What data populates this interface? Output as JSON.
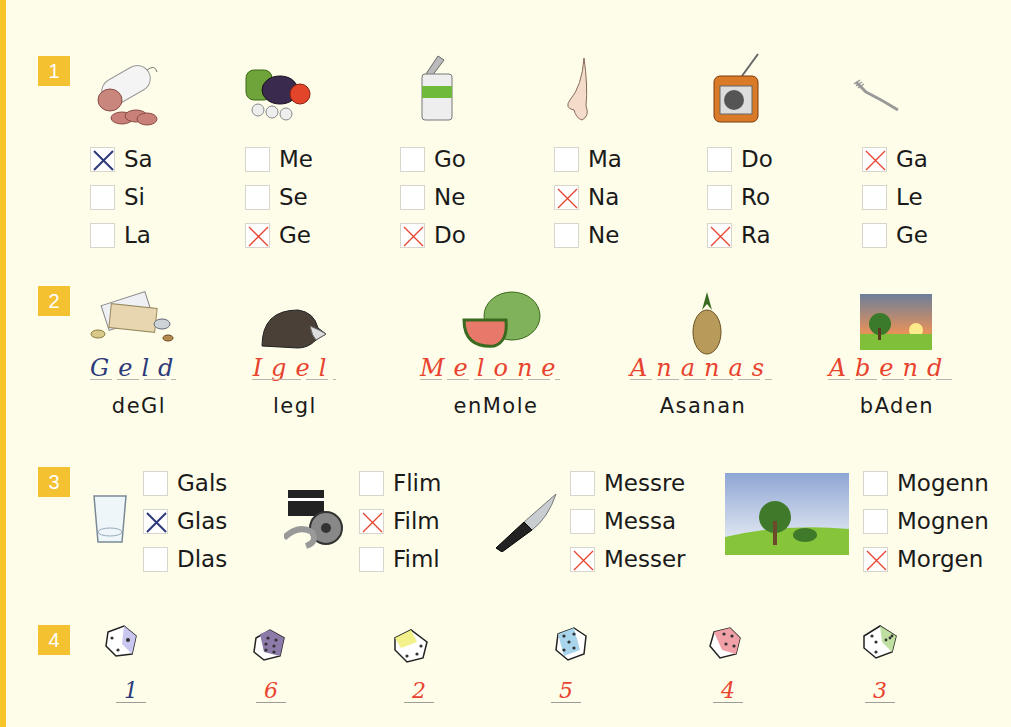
{
  "colors": {
    "background": "#fefde9",
    "stripe": "#f7c52a",
    "badge": "#f4c131",
    "answer_blue": "#2d3a7a",
    "answer_red": "#e8432f"
  },
  "exercise1": {
    "number": "1",
    "groups": [
      {
        "picture": "salami",
        "options": [
          {
            "label": "Sa",
            "checked": "blue"
          },
          {
            "label": "Si",
            "checked": ""
          },
          {
            "label": "La",
            "checked": ""
          }
        ]
      },
      {
        "picture": "vegetables",
        "options": [
          {
            "label": "Me",
            "checked": ""
          },
          {
            "label": "Se",
            "checked": ""
          },
          {
            "label": "Ge",
            "checked": "red"
          }
        ]
      },
      {
        "picture": "tin-can",
        "options": [
          {
            "label": "Go",
            "checked": ""
          },
          {
            "label": "Ne",
            "checked": ""
          },
          {
            "label": "Do",
            "checked": "red"
          }
        ]
      },
      {
        "picture": "nose",
        "options": [
          {
            "label": "Ma",
            "checked": ""
          },
          {
            "label": "Na",
            "checked": "red"
          },
          {
            "label": "Ne",
            "checked": ""
          }
        ]
      },
      {
        "picture": "radio",
        "options": [
          {
            "label": "Do",
            "checked": ""
          },
          {
            "label": "Ro",
            "checked": ""
          },
          {
            "label": "Ra",
            "checked": "red"
          }
        ]
      },
      {
        "picture": "fork",
        "options": [
          {
            "label": "Ga",
            "checked": "red"
          },
          {
            "label": "Le",
            "checked": ""
          },
          {
            "label": "Ge",
            "checked": ""
          }
        ]
      }
    ]
  },
  "exercise2": {
    "number": "2",
    "items": [
      {
        "picture": "money",
        "answer": "Geld",
        "answer_color": "blue",
        "scrambled": "deGl"
      },
      {
        "picture": "hedgehog",
        "answer": "Igel",
        "answer_color": "red",
        "scrambled": "legl"
      },
      {
        "picture": "watermelon",
        "answer": "Melone",
        "answer_color": "red",
        "scrambled": "enMole"
      },
      {
        "picture": "pineapple",
        "answer": "Ananas",
        "answer_color": "red",
        "scrambled": "Asanan"
      },
      {
        "picture": "evening-landscape",
        "answer": "Abend",
        "answer_color": "red",
        "scrambled": "bAden"
      }
    ]
  },
  "exercise3": {
    "number": "3",
    "groups": [
      {
        "picture": "glass",
        "options": [
          {
            "label": "Gals",
            "checked": ""
          },
          {
            "label": "Glas",
            "checked": "blue"
          },
          {
            "label": "Dlas",
            "checked": ""
          }
        ]
      },
      {
        "picture": "film-clapper-reel",
        "options": [
          {
            "label": "Flim",
            "checked": ""
          },
          {
            "label": "Film",
            "checked": "red"
          },
          {
            "label": "Fiml",
            "checked": ""
          }
        ]
      },
      {
        "picture": "knife",
        "options": [
          {
            "label": "Messre",
            "checked": ""
          },
          {
            "label": "Messa",
            "checked": ""
          },
          {
            "label": "Messer",
            "checked": "red"
          }
        ]
      },
      {
        "picture": "morning-landscape",
        "options": [
          {
            "label": "Mogenn",
            "checked": ""
          },
          {
            "label": "Mognen",
            "checked": ""
          },
          {
            "label": "Morgen",
            "checked": "red"
          }
        ]
      }
    ]
  },
  "exercise4": {
    "number": "4",
    "dice": [
      {
        "face_color": "#c9c6ef",
        "answer": "1",
        "answer_color": "blue"
      },
      {
        "face_color": "#8c7aa8",
        "answer": "6",
        "answer_color": "red"
      },
      {
        "face_color": "#f3f18a",
        "answer": "2",
        "answer_color": "red"
      },
      {
        "face_color": "#a8d4ec",
        "answer": "5",
        "answer_color": "red"
      },
      {
        "face_color": "#f0a0a6",
        "answer": "4",
        "answer_color": "red"
      },
      {
        "face_color": "#bfe0a0",
        "answer": "3",
        "answer_color": "red"
      }
    ]
  }
}
